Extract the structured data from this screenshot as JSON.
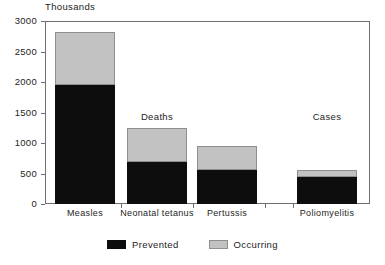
{
  "chart_data": {
    "type": "bar",
    "subtype": "stacked-bar",
    "title": "",
    "unit_label": "Thousands",
    "xlabel": "",
    "ylabel": "",
    "ylim": [
      0,
      3000
    ],
    "ytick_values": [
      3000,
      2500,
      2000,
      1500,
      1000,
      500,
      0
    ],
    "ytick_labels": [
      "3000",
      "2500",
      "2000",
      "1500",
      "1000",
      "500",
      "0"
    ],
    "grid": false,
    "legend_position": "bottom-center",
    "categories": [
      "Measles",
      "Neonatal tetanus",
      "Pertussis",
      "Poliomyelitis"
    ],
    "series": [
      {
        "name": "Prevented",
        "color": "#0d0d0d",
        "values": [
          1950,
          690,
          560,
          440
        ]
      },
      {
        "name": "Occurring",
        "color": "#c2c2c2",
        "values": [
          870,
          560,
          390,
          120
        ]
      }
    ],
    "totals": [
      2820,
      1250,
      950,
      560
    ],
    "annotations": [
      {
        "text": "Deaths",
        "x_category": "Neonatal tetanus",
        "y_value": 1430
      },
      {
        "text": "Cases",
        "x_category": "Poliomyelitis",
        "y_value": 1430
      }
    ]
  },
  "legend": {
    "items": [
      {
        "label": "Prevented",
        "color": "#0d0d0d"
      },
      {
        "label": "Occurring",
        "color": "#c2c2c2"
      }
    ]
  },
  "axes": {
    "y": {
      "ticks": [
        {
          "label": "3000",
          "value": 3000
        },
        {
          "label": "2500",
          "value": 2500
        },
        {
          "label": "2000",
          "value": 2000
        },
        {
          "label": "1500",
          "value": 1500
        },
        {
          "label": "1000",
          "value": 1000
        },
        {
          "label": "500",
          "value": 500
        },
        {
          "label": "0",
          "value": 0
        }
      ]
    },
    "x": {
      "labels": [
        "Measles",
        "Neonatal tetanus",
        "Pertussis",
        "Poliomyelitis"
      ]
    }
  },
  "unit_label": "Thousands",
  "annotations": {
    "deaths": "Deaths",
    "cases": "Cases"
  },
  "colors": {
    "prevented": "#0d0d0d",
    "occurring": "#c2c2c2",
    "axis": "#6f6f6f",
    "text": "#1d1d1d",
    "background": "#ffffff"
  }
}
